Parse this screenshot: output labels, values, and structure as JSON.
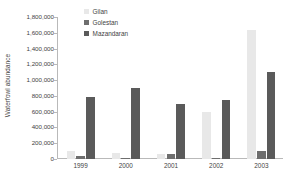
{
  "chart_data": {
    "type": "bar",
    "title": "",
    "xlabel": "",
    "ylabel": "Waterfowl abundance",
    "categories": [
      "1999",
      "2000",
      "2001",
      "2002",
      "2003"
    ],
    "series": [
      {
        "name": "Gilan",
        "color": "#e8e8e8",
        "values": [
          100000,
          80000,
          60000,
          595000,
          1640000
        ]
      },
      {
        "name": "Golestan",
        "color": "#6e6e6e",
        "values": [
          40000,
          15000,
          60000,
          12000,
          100000
        ]
      },
      {
        "name": "Mazandaran",
        "color": "#5a5a5a",
        "values": [
          790000,
          895000,
          695000,
          745000,
          1100000
        ]
      }
    ],
    "ylim": [
      0,
      1800000
    ],
    "y_tick_step": 200000,
    "y_ticks": [
      "0",
      "200,000",
      "400,000",
      "600,000",
      "800,000",
      "1,000,000",
      "1,200,000",
      "1,400,000",
      "1,600,000",
      "1,800,000"
    ],
    "grid": false,
    "legend_position": "top-left-inside",
    "axis_color": "#b9b9b9"
  }
}
